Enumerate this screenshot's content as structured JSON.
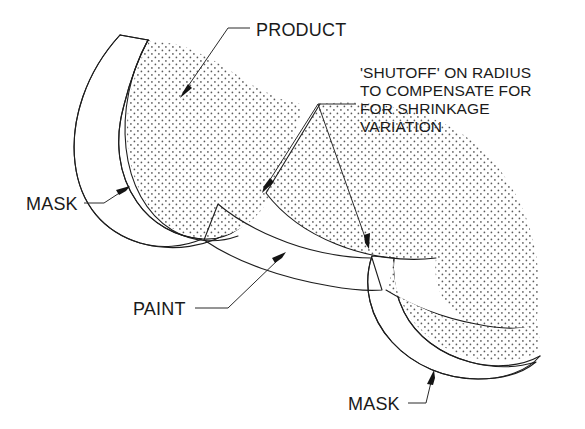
{
  "figure": {
    "type": "technical-illustration",
    "title_visible": false,
    "background_color": "#ffffff",
    "line_color": "#1d1d1d",
    "text_color": "#1a1a1a"
  },
  "labels": {
    "product": "PRODUCT",
    "mask_left": "MASK",
    "mask_bottom": "MASK",
    "paint": "PAINT"
  },
  "note": {
    "lines": [
      "'SHUTOFF' ON RADIUS",
      "TO COMPENSATE FOR",
      "FOR SHRINKAGE",
      "VARIATION"
    ]
  },
  "regions": {
    "product_fill": "stipple-dots",
    "mask_fill": "diagonal-hatch",
    "paint_fill": "white"
  }
}
